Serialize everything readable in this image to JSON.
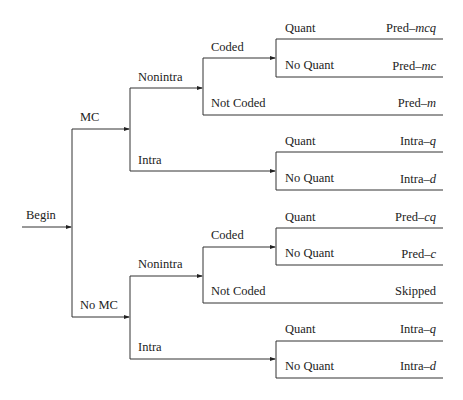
{
  "header": {
    "cut_text": "… … … … … … … … … … … … … … … … … …"
  },
  "diagram": {
    "root": "Begin",
    "level1": {
      "upper": "MC",
      "lower": "No MC"
    },
    "level2": {
      "mc_nonintra": "Nonintra",
      "mc_intra": "Intra",
      "nomc_nonintra": "Nonintra",
      "nomc_intra": "Intra"
    },
    "level3": {
      "mc_coded": "Coded",
      "mc_not_coded": "Not Coded",
      "nomc_coded": "Coded",
      "nomc_not_coded": "Not Coded"
    },
    "level4": {
      "b1_quant": "Quant",
      "b1_noquant": "No Quant",
      "b2_quant": "Quant",
      "b2_noquant": "No Quant",
      "b3_quant": "Quant",
      "b3_noquant": "No Quant",
      "b4_quant": "Quant",
      "b4_noquant": "No Quant"
    },
    "outcomes": [
      {
        "prefix": "Pred–",
        "suffix": "mcq"
      },
      {
        "prefix": "Pred–",
        "suffix": "mc"
      },
      {
        "prefix": "Pred–",
        "suffix": "m"
      },
      {
        "prefix": "Intra–",
        "suffix": "q"
      },
      {
        "prefix": "Intra–",
        "suffix": "d"
      },
      {
        "prefix": "Pred–",
        "suffix": "cq"
      },
      {
        "prefix": "Pred–",
        "suffix": "c"
      },
      {
        "prefix": "",
        "suffix": "",
        "plain": "Skipped"
      },
      {
        "prefix": "Intra–",
        "suffix": "q"
      },
      {
        "prefix": "Intra–",
        "suffix": "d"
      }
    ]
  }
}
